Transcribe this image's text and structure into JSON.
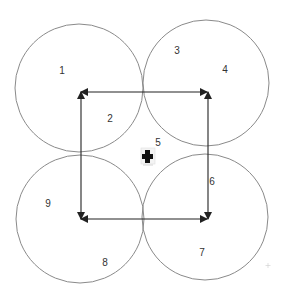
{
  "diagram": {
    "width": 285,
    "height": 302,
    "background": "#ffffff",
    "circle_stroke": "#8a8a8a",
    "arrow_color": "#222222",
    "circles": [
      {
        "id": "top-left",
        "cx": 79,
        "cy": 88,
        "r": 64
      },
      {
        "id": "top-right",
        "cx": 206,
        "cy": 83,
        "r": 63
      },
      {
        "id": "bottom-left",
        "cx": 80,
        "cy": 219,
        "r": 64
      },
      {
        "id": "bottom-right",
        "cx": 205,
        "cy": 217,
        "r": 63
      }
    ],
    "arrows": [
      {
        "id": "top",
        "x1": 81,
        "y1": 92,
        "x2": 207,
        "y2": 92,
        "heads": "both"
      },
      {
        "id": "left",
        "x1": 81,
        "y1": 92,
        "x2": 81,
        "y2": 219,
        "heads": "both"
      },
      {
        "id": "right",
        "x1": 208,
        "y1": 92,
        "x2": 208,
        "y2": 219,
        "heads": "both"
      },
      {
        "id": "bottom",
        "x1": 81,
        "y1": 219,
        "x2": 207,
        "y2": 219,
        "heads": "both"
      }
    ],
    "labels": [
      {
        "text": "1",
        "x": 62,
        "y": 71
      },
      {
        "text": "2",
        "x": 110,
        "y": 119
      },
      {
        "text": "3",
        "x": 177,
        "y": 51
      },
      {
        "text": "4",
        "x": 225,
        "y": 70
      },
      {
        "text": "5",
        "x": 158,
        "y": 143
      },
      {
        "text": "6",
        "x": 212,
        "y": 182
      },
      {
        "text": "7",
        "x": 202,
        "y": 253
      },
      {
        "text": "8",
        "x": 105,
        "y": 263
      },
      {
        "text": "9",
        "x": 48,
        "y": 204
      }
    ],
    "center_icon": {
      "name": "cross-marker-icon",
      "x": 148,
      "y": 157
    }
  }
}
